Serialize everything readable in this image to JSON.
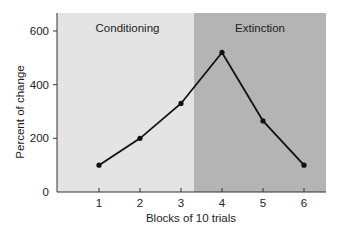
{
  "chart_data": {
    "type": "line",
    "title": "",
    "xlabel": "Blocks of 10 trials",
    "ylabel": "Percent of change",
    "x": [
      1,
      2,
      3,
      4,
      5,
      6
    ],
    "categories": [
      "1",
      "2",
      "3",
      "4",
      "5",
      "6"
    ],
    "series": [
      {
        "name": "Percent of change",
        "values": [
          100,
          200,
          330,
          520,
          265,
          100
        ]
      }
    ],
    "ylim": [
      0,
      650
    ],
    "yticks": [
      0,
      200,
      400,
      600
    ],
    "ytick_labels": [
      "0",
      "200",
      "400",
      "600"
    ],
    "xticks": [
      1,
      2,
      3,
      4,
      5,
      6
    ],
    "grid": false,
    "legend": null,
    "regions": [
      {
        "label": "Conditioning",
        "x_from": 0.1,
        "x_to": 3.3,
        "color": "#e4e4e4"
      },
      {
        "label": "Extinction",
        "x_from": 3.3,
        "x_to": 6.6,
        "color": "#b4b4b4"
      }
    ],
    "line_color": "#111111",
    "marker": "circle"
  }
}
